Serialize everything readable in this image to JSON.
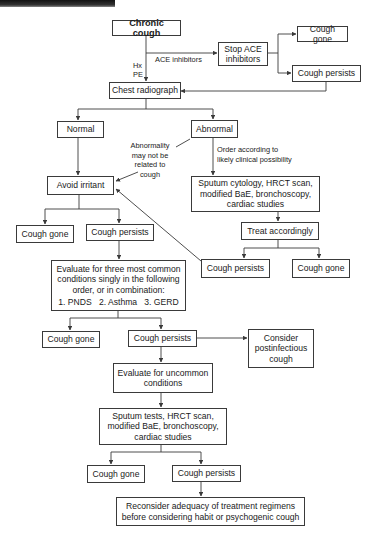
{
  "diagram": {
    "title": "Chronic cough",
    "nodes": {
      "chronic_cough": "Chronic cough",
      "stop_ace": [
        "Stop ACE",
        "inhibitors"
      ],
      "ace_cough_gone": "Cough gone",
      "ace_cough_persists": "Cough persists",
      "chest_radiograph": "Chest radiograph",
      "normal": "Normal",
      "abnormal": "Abnormal",
      "avoid_irritant": "Avoid irritant",
      "irritant_cough_gone": "Cough gone",
      "irritant_cough_persists": "Cough persists",
      "abnormal_workup": [
        "Sputum cytology, HRCT scan,",
        "modified BaE, bronchoscopy,",
        "cardiac studies"
      ],
      "treat_accordingly": "Treat accordingly",
      "treat_cough_persists": "Cough persists",
      "treat_cough_gone": "Cough gone",
      "evaluate_common": [
        "Evaluate for three most common",
        "conditions singly in the following",
        "order, or in combination:",
        "1. PNDS   2. Asthma   3. GERD"
      ],
      "common_cough_gone": "Cough gone",
      "common_cough_persists": "Cough persists",
      "postinfectious": [
        "Consider",
        "postinfectious",
        "cough"
      ],
      "evaluate_uncommon": [
        "Evaluate for uncommon",
        "conditions"
      ],
      "uncommon_workup": [
        "Sputum tests, HRCT scan,",
        "modified BaE, bronchoscopy,",
        "cardiac studies"
      ],
      "final_cough_gone": "Cough gone",
      "final_cough_persists": "Cough persists",
      "reconsider": [
        "Reconsider adequacy of treatment regimens",
        "before considering habit or psychogenic cough"
      ]
    },
    "edge_labels": {
      "ace_inhibitors": "ACE inhibitors",
      "hx": "Hx",
      "pe": "PE",
      "abnormality_note": [
        "Abnormality",
        "may not be",
        "related to",
        "cough"
      ],
      "order_note": [
        "Order according to",
        "likely clinical possibility"
      ]
    }
  }
}
